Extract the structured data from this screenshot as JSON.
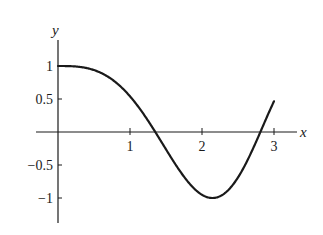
{
  "chart_data": {
    "type": "line",
    "title": "",
    "xlabel": "x",
    "ylabel": "y",
    "xlim": [
      -0.3,
      3.3
    ],
    "ylim": [
      -1.35,
      1.4
    ],
    "grid": false,
    "legend": null,
    "x_ticks": [
      1,
      2,
      3
    ],
    "x_tick_labels": [
      "1",
      "2",
      "3"
    ],
    "y_ticks": [
      1,
      0.5,
      -0.5,
      -1
    ],
    "y_tick_labels": [
      "1",
      "0.5",
      "−0.5",
      "−1"
    ],
    "function": "y = cos(x^1.5)",
    "series": [
      {
        "name": "curve",
        "x": [
          0,
          0.25,
          0.5,
          0.75,
          1.0,
          1.25,
          1.37,
          1.5,
          1.75,
          2.0,
          2.18,
          2.25,
          2.5,
          2.75,
          2.83,
          3.0
        ],
        "y": [
          1.0,
          1.0,
          0.94,
          0.79,
          0.54,
          0.18,
          0.0,
          -0.33,
          -0.81,
          -0.95,
          -1.0,
          -0.99,
          -0.72,
          -0.14,
          0.0,
          0.47
        ]
      }
    ],
    "annotations": []
  },
  "axes": {
    "x_label": "x",
    "y_label": "y"
  }
}
